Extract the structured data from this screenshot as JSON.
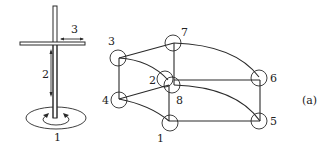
{
  "figure": {
    "panel_label": "(a)",
    "mechanism": {
      "joint_labels": [
        "1",
        "2",
        "3"
      ],
      "joint_descriptions": {
        "1": "rotation about vertical axis",
        "2": "vertical translation",
        "3": "horizontal translation"
      }
    },
    "graph": {
      "nodes": [
        {
          "id": "1",
          "label": "1"
        },
        {
          "id": "2",
          "label": "2"
        },
        {
          "id": "3",
          "label": "3"
        },
        {
          "id": "4",
          "label": "4"
        },
        {
          "id": "5",
          "label": "5"
        },
        {
          "id": "6",
          "label": "6"
        },
        {
          "id": "7",
          "label": "7"
        },
        {
          "id": "8",
          "label": "8"
        }
      ],
      "edges": [
        {
          "from": "3",
          "to": "4",
          "style": "straight"
        },
        {
          "from": "3",
          "to": "7",
          "style": "straight"
        },
        {
          "from": "3",
          "to": "8",
          "style": "curved"
        },
        {
          "from": "4",
          "to": "8",
          "style": "straight"
        },
        {
          "from": "4",
          "to": "1",
          "style": "curved"
        },
        {
          "from": "7",
          "to": "8",
          "style": "straight"
        },
        {
          "from": "7",
          "to": "6",
          "style": "curved"
        },
        {
          "from": "8",
          "to": "1",
          "style": "straight"
        },
        {
          "from": "8",
          "to": "6",
          "style": "straight"
        },
        {
          "from": "8",
          "to": "5",
          "style": "curved"
        },
        {
          "from": "1",
          "to": "5",
          "style": "straight"
        },
        {
          "from": "6",
          "to": "5",
          "style": "straight"
        }
      ]
    }
  }
}
